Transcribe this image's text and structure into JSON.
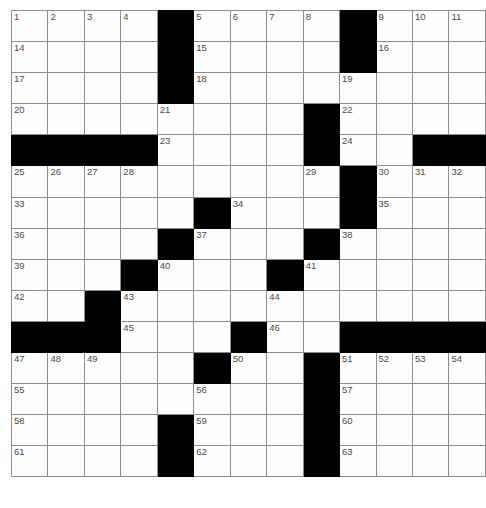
{
  "puzzle": {
    "title": "Crossword Puzzle Grid",
    "rows": 16,
    "cols": 13,
    "colors": {
      "block": "#000000",
      "cell": "#fefefe",
      "grid_line": "#8d8d8d",
      "outer_border": "#6f6f6f",
      "number_text": "#4a4a4a",
      "page_background": "#ffffff"
    },
    "max_clue_number": 63,
    "grid": [
      [
        {
          "n": "1"
        },
        {
          "n": "2"
        },
        {
          "n": "3"
        },
        {
          "n": "4"
        },
        {
          "b": true
        },
        {
          "n": "5"
        },
        {
          "n": "6"
        },
        {
          "n": "7"
        },
        {
          "n": "8"
        },
        {
          "b": true
        },
        {
          "n": "9"
        },
        {
          "n": "10"
        },
        {
          "n": "11"
        }
      ],
      [
        {
          "n": "14"
        },
        {},
        {},
        {},
        {
          "b": true
        },
        {
          "n": "15"
        },
        {},
        {},
        {},
        {
          "b": true
        },
        {
          "n": "16"
        },
        {},
        {}
      ],
      [
        {
          "n": "17"
        },
        {},
        {},
        {},
        {
          "b": true
        },
        {
          "n": "18"
        },
        {},
        {},
        {},
        {
          "n": "19"
        },
        {},
        {},
        {}
      ],
      [
        {
          "n": "20"
        },
        {},
        {},
        {},
        {
          "n": "21"
        },
        {},
        {},
        {},
        {
          "b": true
        },
        {
          "n": "22"
        },
        {},
        {},
        {}
      ],
      [
        {
          "b": true
        },
        {
          "b": true
        },
        {
          "b": true
        },
        {
          "b": true
        },
        {
          "n": "23"
        },
        {},
        {},
        {},
        {
          "b": true
        },
        {
          "n": "24"
        },
        {},
        {},
        {}
      ],
      [
        {
          "n": "25"
        },
        {
          "n": "26"
        },
        {
          "n": "27"
        },
        {
          "n": "28"
        },
        {},
        {},
        {},
        {},
        {
          "n": "29"
        },
        {},
        {},
        {},
        {}
      ],
      [
        {
          "n": "33"
        },
        {},
        {},
        {},
        {},
        {},
        {},
        {},
        {},
        {
          "b": true
        },
        {
          "n": "30"
        },
        {
          "n": "31"
        },
        {
          "n": "32"
        }
      ],
      [
        {
          "n": "36"
        },
        {},
        {},
        {},
        {},
        {
          "b": true
        },
        {
          "n": "34"
        },
        {},
        {},
        {
          "b": true
        },
        {
          "n": "35"
        },
        {},
        {}
      ],
      [
        {
          "n": "39"
        },
        {},
        {},
        {},
        {
          "b": true
        },
        {
          "n": "37"
        },
        {},
        {},
        {
          "b": true
        },
        {
          "n": "38"
        },
        {},
        {},
        {}
      ],
      [
        {
          "n": "42"
        },
        {},
        {},
        {
          "b": true
        },
        {
          "n": "40"
        },
        {},
        {},
        {
          "b": true
        },
        {
          "n": "41"
        },
        {},
        {},
        {},
        {}
      ],
      [
        {
          "n": "45"
        },
        {},
        {
          "b": true
        },
        {
          "n": "43"
        },
        {},
        {},
        {},
        {
          "n": "44"
        },
        {},
        {},
        {},
        {},
        {}
      ],
      [
        {
          "b": true
        },
        {
          "b": true
        },
        {
          "b": true
        },
        {
          "n": "47"
        },
        {},
        {},
        {
          "b": true
        },
        {
          "n": "46"
        },
        {},
        {
          "b": true
        },
        {
          "b": true
        },
        {
          "b": true
        },
        {
          "b": true
        }
      ],
      [
        {
          "n": "48"
        },
        {
          "n": "49"
        },
        {
          "n": "50"
        },
        {},
        {},
        {
          "b": true
        },
        {},
        {},
        {},
        {
          "n": "51"
        },
        {
          "n": "52"
        },
        {
          "n": "53"
        },
        {
          "n": "54"
        }
      ],
      [
        {
          "n": "55"
        },
        {},
        {},
        {},
        {},
        {
          "n": "56"
        },
        {},
        {},
        {
          "b": true
        },
        {
          "n": "57"
        },
        {},
        {},
        {}
      ],
      [
        {
          "n": "58"
        },
        {},
        {},
        {},
        {
          "b": true
        },
        {
          "n": "59"
        },
        {},
        {},
        {
          "b": true
        },
        {
          "n": "60"
        },
        {},
        {},
        {}
      ],
      [
        {
          "n": "61"
        },
        {},
        {},
        {},
        {
          "b": true
        },
        {
          "n": "62"
        },
        {},
        {},
        {
          "b": true
        },
        {
          "n": "63"
        },
        {},
        {},
        {}
      ]
    ]
  }
}
